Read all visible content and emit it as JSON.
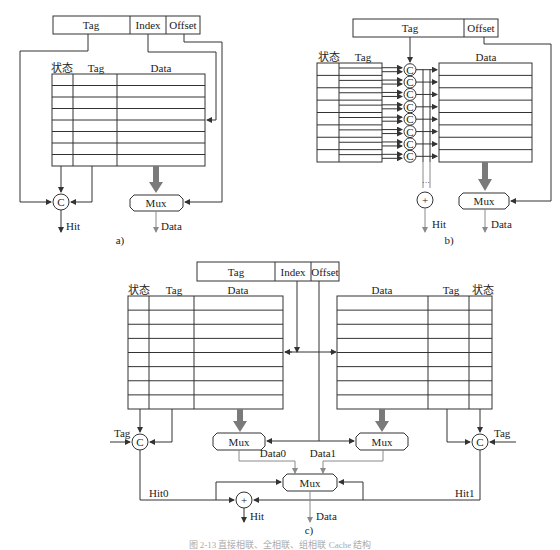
{
  "figure": {
    "caption": "图 2-13  直接相联、全相联、组相联 Cache 结构",
    "colors": {
      "line": "#333333",
      "data_path": "#7a7a7a",
      "caption": "#aaaaaa"
    }
  },
  "panel_a": {
    "sublabel": "a)",
    "address_fields": [
      "Tag",
      "Index",
      "Offset"
    ],
    "table_headers": [
      "状态",
      "Tag",
      "Data"
    ],
    "rows": 8,
    "comparator": "C",
    "mux": "Mux",
    "outputs": {
      "hit": "Hit",
      "data": "Data"
    }
  },
  "panel_b": {
    "sublabel": "b)",
    "address_fields": [
      "Tag",
      "Offset"
    ],
    "table_headers": [
      "状态",
      "Tag",
      "Data"
    ],
    "rows": 8,
    "comparator": "C",
    "or_gate": "+",
    "ellipsis": "···",
    "mux": "Mux",
    "outputs": {
      "hit": "Hit",
      "data": "Data"
    }
  },
  "panel_c": {
    "sublabel": "c)",
    "address_fields": [
      "Tag",
      "Index",
      "Offset"
    ],
    "left_table_headers": [
      "状态",
      "Tag",
      "Data"
    ],
    "right_table_headers": [
      "Data",
      "Tag",
      "状态"
    ],
    "rows": 8,
    "comparator": "C",
    "tag_input": "Tag",
    "mux": "Mux",
    "way_data": [
      "Data0",
      "Data1"
    ],
    "hits": [
      "Hit0",
      "Hit1"
    ],
    "or_gate": "+",
    "outputs": {
      "hit": "Hit",
      "data": "Data"
    }
  }
}
